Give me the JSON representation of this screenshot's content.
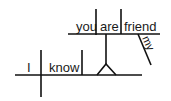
{
  "diagram": {
    "type": "sentence-diagram",
    "sentence": "I know you are my friend",
    "main_clause": {
      "subject": "I",
      "verb": "know"
    },
    "noun_clause": {
      "subject": "you",
      "verb": "are",
      "predicate_nominative": "friend",
      "modifier": "my"
    },
    "colors": {
      "line": "#111111",
      "text": "#1a1a1a",
      "background": "#ffffff"
    }
  }
}
